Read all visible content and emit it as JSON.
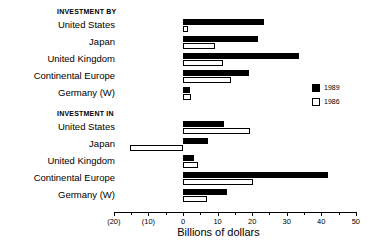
{
  "chart_data": {
    "type": "bar",
    "orientation": "horizontal",
    "title": "",
    "xlabel": "Billions of dollars",
    "ylabel": "",
    "xlim": [
      -20,
      50
    ],
    "xticks": [
      -20,
      -10,
      0,
      10,
      20,
      30,
      40,
      50
    ],
    "xticklabels": [
      "(20)",
      "(10)",
      "0",
      "10",
      "20",
      "30",
      "40",
      "50"
    ],
    "grid": false,
    "legend_position": "right",
    "legend": [
      "1989",
      "1986"
    ],
    "colors": {
      "series_1989": "#000000",
      "series_1986": "#ffffff",
      "outline": "#000000"
    },
    "panels": [
      {
        "title": "INVESTMENT BY",
        "categories": [
          "United States",
          "Japan",
          "United Kingdom",
          "Continental Europe",
          "Germany (W)"
        ],
        "series": [
          {
            "name": "1989",
            "values": [
              23.4,
              21.7,
              33.5,
              19.0,
              2.0
            ]
          },
          {
            "name": "1986",
            "values": [
              1.5,
              9.2,
              11.5,
              14.0,
              2.3
            ]
          }
        ]
      },
      {
        "title": "INVESTMENT IN",
        "categories": [
          "United States",
          "Japan",
          "United Kingdom",
          "Continental Europe",
          "Germany (W)"
        ],
        "series": [
          {
            "name": "1989",
            "values": [
              12.0,
              7.2,
              3.2,
              42.0,
              12.7
            ]
          },
          {
            "name": "1986",
            "values": [
              19.5,
              -15.3,
              4.3,
              20.3,
              7.0
            ]
          }
        ]
      }
    ]
  }
}
